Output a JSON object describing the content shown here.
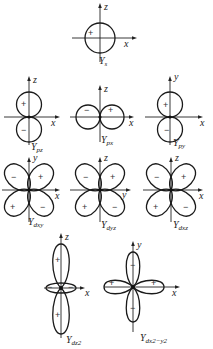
{
  "diagram": {
    "orbitals": [
      {
        "id": "s",
        "name": "Y",
        "sub": "s",
        "axes": {
          "vertical": "z",
          "horizontal": "x"
        },
        "signs": [
          "+"
        ]
      },
      {
        "id": "pz",
        "name": "Y",
        "sub": "pz",
        "axes": {
          "vertical": "z",
          "horizontal": "x"
        },
        "signs": [
          "+",
          "−"
        ]
      },
      {
        "id": "px",
        "name": "Y",
        "sub": "px",
        "axes": {
          "vertical": "z",
          "horizontal": "x"
        },
        "signs": [
          "−",
          "+"
        ]
      },
      {
        "id": "py",
        "name": "Y",
        "sub": "py",
        "axes": {
          "vertical": "y",
          "horizontal": "x"
        },
        "signs": [
          "+",
          "−"
        ]
      },
      {
        "id": "dxy",
        "name": "Y",
        "sub": "dxy",
        "axes": {
          "vertical": "y",
          "horizontal": "x"
        },
        "signs": [
          "−",
          "+",
          "+",
          "−"
        ]
      },
      {
        "id": "dyz",
        "name": "Y",
        "sub": "dyz",
        "axes": {
          "vertical": "z",
          "horizontal": "y"
        },
        "signs": [
          "−",
          "+",
          "+",
          "−"
        ]
      },
      {
        "id": "dxz",
        "name": "Y",
        "sub": "dxz",
        "axes": {
          "vertical": "z",
          "horizontal": "x"
        },
        "signs": [
          "−",
          "+",
          "+",
          "−"
        ]
      },
      {
        "id": "dz2",
        "name": "Y",
        "sub": "dz2",
        "axes": {
          "vertical": "z",
          "horizontal": "x"
        },
        "signs": [
          "+",
          "−",
          "−",
          "+"
        ]
      },
      {
        "id": "dx2y2",
        "name": "Y",
        "sub": "dx2−y2",
        "axes": {
          "vertical": "y",
          "horizontal": "x"
        },
        "signs": [
          "−",
          "+",
          "+",
          "−"
        ]
      }
    ]
  }
}
